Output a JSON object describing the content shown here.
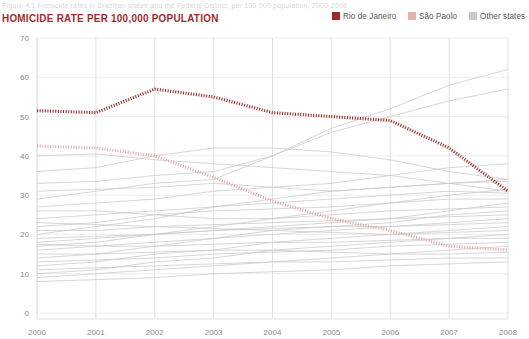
{
  "figure": {
    "caption": "Figure 4.1   Homicide rates in Brazilian states and the Federal District, per 100,000 population, 2000-2008"
  },
  "chart_title": "HOMICIDE RATE PER 100,000 POPULATION",
  "legend": {
    "items": [
      {
        "label": "Rio de Janeiro",
        "color": "#9e2b2b",
        "icon": "square-swatch"
      },
      {
        "label": "São Paolo",
        "color": "#e3b0ad",
        "icon": "square-swatch"
      },
      {
        "label": "Other states",
        "color": "#c9c9c9",
        "icon": "square-swatch"
      }
    ]
  },
  "chart_data": {
    "type": "line",
    "title": "HOMICIDE RATE PER 100,000 POPULATION",
    "xlabel": "",
    "ylabel": "",
    "x": [
      2000,
      2001,
      2002,
      2003,
      2004,
      2005,
      2006,
      2007,
      2008
    ],
    "xtick_labels": [
      "2000",
      "2001",
      "2002",
      "2003",
      "2004",
      "2005",
      "2006",
      "2007",
      "2008"
    ],
    "ytick_labels": [
      "0",
      "10",
      "20",
      "30",
      "40",
      "50",
      "60",
      "70"
    ],
    "ylim": [
      0,
      70
    ],
    "xlim": [
      2000,
      2008
    ],
    "grid": true,
    "legend_position": "top-right",
    "series": [
      {
        "name": "Rio de Janeiro",
        "color": "#9e2b2b",
        "style": "dashed-thick",
        "values": [
          51.5,
          51.0,
          57.0,
          55.0,
          51.0,
          50.0,
          49.0,
          42.0,
          31.0
        ]
      },
      {
        "name": "São Paolo",
        "color": "#e3b0ad",
        "style": "dashed-thick",
        "values": [
          42.5,
          42.0,
          40.0,
          34.5,
          28.5,
          24.0,
          21.0,
          17.0,
          16.0
        ]
      }
    ],
    "other_states": {
      "name": "Other states",
      "color": "#c9c9c9",
      "count": 25,
      "series": [
        {
          "values": [
            29.0,
            31.0,
            33.0,
            34.0,
            40.0,
            47.0,
            52.0,
            58.0,
            62.0
          ]
        },
        {
          "values": [
            33.0,
            33.5,
            35.0,
            36.0,
            40.0,
            46.0,
            50.0,
            54.0,
            57.0
          ]
        },
        {
          "values": [
            27.0,
            28.0,
            29.0,
            31.0,
            32.0,
            33.0,
            35.0,
            37.0,
            38.0
          ]
        },
        {
          "values": [
            36.0,
            37.0,
            40.0,
            42.0,
            42.0,
            41.0,
            39.0,
            36.0,
            34.0
          ]
        },
        {
          "values": [
            40.0,
            40.5,
            39.0,
            38.0,
            37.0,
            36.0,
            35.0,
            33.0,
            31.0
          ]
        },
        {
          "values": [
            31.0,
            31.5,
            32.0,
            33.0,
            32.0,
            31.0,
            32.0,
            33.0,
            34.0
          ]
        },
        {
          "values": [
            20.0,
            22.0,
            24.0,
            27.0,
            29.0,
            31.0,
            32.0,
            33.0,
            33.5
          ]
        },
        {
          "values": [
            24.0,
            25.0,
            26.0,
            27.0,
            28.0,
            29.0,
            30.0,
            31.0,
            30.5
          ]
        },
        {
          "values": [
            17.0,
            18.0,
            20.0,
            22.0,
            24.0,
            26.0,
            28.0,
            30.0,
            31.5
          ]
        },
        {
          "values": [
            22.0,
            23.0,
            25.0,
            26.0,
            26.5,
            27.0,
            28.0,
            29.0,
            29.0
          ]
        },
        {
          "values": [
            18.0,
            19.0,
            20.0,
            21.0,
            22.0,
            23.0,
            24.0,
            26.0,
            28.0
          ]
        },
        {
          "values": [
            26.0,
            26.0,
            25.0,
            24.0,
            24.0,
            25.0,
            26.0,
            26.5,
            27.0
          ]
        },
        {
          "values": [
            14.0,
            15.0,
            17.0,
            19.0,
            21.0,
            22.0,
            23.0,
            25.0,
            26.0
          ]
        },
        {
          "values": [
            21.0,
            21.0,
            22.0,
            22.5,
            23.0,
            23.5,
            24.0,
            24.5,
            25.0
          ]
        },
        {
          "values": [
            16.0,
            17.0,
            18.0,
            19.0,
            20.0,
            21.0,
            22.0,
            23.0,
            24.0
          ]
        },
        {
          "values": [
            19.0,
            19.5,
            20.0,
            21.0,
            21.5,
            22.0,
            22.0,
            22.5,
            23.0
          ]
        },
        {
          "values": [
            12.0,
            13.0,
            15.0,
            16.0,
            18.0,
            19.0,
            20.0,
            21.0,
            22.0
          ]
        },
        {
          "values": [
            23.0,
            22.5,
            22.0,
            21.5,
            21.0,
            20.5,
            20.0,
            20.5,
            21.0
          ]
        },
        {
          "values": [
            10.0,
            11.0,
            13.0,
            14.0,
            16.0,
            17.0,
            18.0,
            19.0,
            20.0
          ]
        },
        {
          "values": [
            17.5,
            17.0,
            17.0,
            17.5,
            18.0,
            18.0,
            18.5,
            19.0,
            19.0
          ]
        },
        {
          "values": [
            13.0,
            13.5,
            14.0,
            15.0,
            15.5,
            16.0,
            17.0,
            17.5,
            18.0
          ]
        },
        {
          "values": [
            9.0,
            10.0,
            11.0,
            12.0,
            13.0,
            14.0,
            15.0,
            16.0,
            17.0
          ]
        },
        {
          "values": [
            15.0,
            15.0,
            15.5,
            16.0,
            16.0,
            15.5,
            15.0,
            15.0,
            15.5
          ]
        },
        {
          "values": [
            11.0,
            11.5,
            12.0,
            12.5,
            13.0,
            13.0,
            13.5,
            14.0,
            14.0
          ]
        },
        {
          "values": [
            8.0,
            8.5,
            9.0,
            10.0,
            10.5,
            11.0,
            12.0,
            12.5,
            13.0
          ]
        }
      ]
    }
  }
}
